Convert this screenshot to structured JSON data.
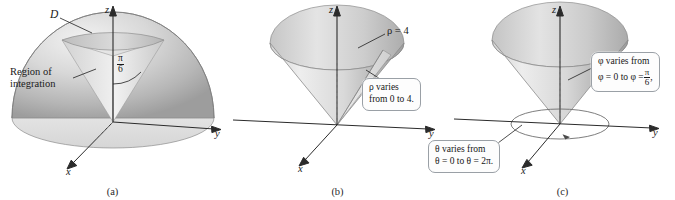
{
  "figure": {
    "panels": [
      {
        "id": "a",
        "caption": "(a)",
        "axes": {
          "x": "x",
          "y": "y",
          "z": "z"
        },
        "labels": {
          "surface": "D",
          "region_line1": "Region of",
          "region_line2": "integration",
          "angle_numerator": "π",
          "angle_denominator": "6"
        }
      },
      {
        "id": "b",
        "caption": "(b)",
        "axes": {
          "x": "x",
          "y": "y",
          "z": "z"
        },
        "labels": {
          "rho_equation": "ρ = 4"
        },
        "callouts": [
          {
            "name": "rho-callout",
            "line1": "ρ varies",
            "line2": "from 0 to 4."
          }
        ]
      },
      {
        "id": "c",
        "caption": "(c)",
        "axes": {
          "x": "x",
          "y": "y",
          "z": "z"
        },
        "callouts": [
          {
            "name": "phi-callout",
            "line1": "φ varies from",
            "line2_prefix": "φ = 0 to φ =",
            "line2_numerator": "π",
            "line2_denominator": "6",
            "line2_suffix": ","
          },
          {
            "name": "theta-callout",
            "line1": "θ varies from",
            "line2": "θ = 0 to θ = 2π."
          }
        ]
      }
    ]
  },
  "colors": {
    "background": "#ffffff",
    "axis": "#2b2b2b",
    "ink": "#1a1a1a",
    "solid_light": "#e6e6e6",
    "solid_mid": "#c4c4c4",
    "solid_dark": "#9a9a9a",
    "callout_border": "#9aa0a6",
    "callout_fill": "#fdfdfd"
  }
}
